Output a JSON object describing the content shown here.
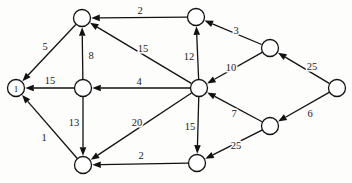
{
  "diagram": {
    "type": "directed-weighted-graph",
    "title": "",
    "background_color": "#fdfdfc",
    "stroke_color": "#111111",
    "nodes": [
      {
        "id": "n1",
        "label": "1",
        "x": 16,
        "y": 88,
        "r": 8.5
      },
      {
        "id": "n2",
        "label": "",
        "x": 82,
        "y": 18,
        "r": 8.5
      },
      {
        "id": "n3",
        "label": "",
        "x": 83,
        "y": 88,
        "r": 8.5
      },
      {
        "id": "n4",
        "label": "",
        "x": 83,
        "y": 165,
        "r": 8.5
      },
      {
        "id": "n5",
        "label": "",
        "x": 196,
        "y": 17,
        "r": 8.5
      },
      {
        "id": "n6",
        "label": "",
        "x": 199,
        "y": 88,
        "r": 8.5
      },
      {
        "id": "n7",
        "label": "",
        "x": 197,
        "y": 163,
        "r": 8.5
      },
      {
        "id": "n8",
        "label": "",
        "x": 270,
        "y": 48,
        "r": 8.5
      },
      {
        "id": "n9",
        "label": "",
        "x": 270,
        "y": 126,
        "r": 8.5
      },
      {
        "id": "n10",
        "label": "",
        "x": 337,
        "y": 88,
        "r": 8.5
      }
    ],
    "edges": [
      {
        "from": "n2",
        "to": "n1",
        "weight": "5",
        "lx": 45,
        "ly": 46
      },
      {
        "from": "n3",
        "to": "n1",
        "weight": "15",
        "lx": 50,
        "ly": 80
      },
      {
        "from": "n4",
        "to": "n1",
        "weight": "1",
        "lx": 44,
        "ly": 137
      },
      {
        "from": "n3",
        "to": "n2",
        "weight": "8",
        "lx": 91,
        "ly": 55
      },
      {
        "from": "n5",
        "to": "n2",
        "weight": "2",
        "lx": 140,
        "ly": 10
      },
      {
        "from": "n6",
        "to": "n2",
        "weight": "15",
        "lx": 143,
        "ly": 48
      },
      {
        "from": "n3",
        "to": "n4",
        "weight": "13",
        "lx": 74,
        "ly": 122
      },
      {
        "from": "n6",
        "to": "n3",
        "weight": "4",
        "lx": 139,
        "ly": 81
      },
      {
        "from": "n6",
        "to": "n4",
        "weight": "20",
        "lx": 137,
        "ly": 122
      },
      {
        "from": "n7",
        "to": "n4",
        "weight": "2",
        "lx": 141,
        "ly": 155
      },
      {
        "from": "n6",
        "to": "n5",
        "weight": "12",
        "lx": 189,
        "ly": 56
      },
      {
        "from": "n8",
        "to": "n5",
        "weight": "3",
        "lx": 236,
        "ly": 30
      },
      {
        "from": "n8",
        "to": "n6",
        "weight": "10",
        "lx": 231,
        "ly": 67
      },
      {
        "from": "n6",
        "to": "n7",
        "weight": "15",
        "lx": 190,
        "ly": 126
      },
      {
        "from": "n9",
        "to": "n6",
        "weight": "7",
        "lx": 234,
        "ly": 113
      },
      {
        "from": "n9",
        "to": "n7",
        "weight": "25",
        "lx": 236,
        "ly": 145
      },
      {
        "from": "n10",
        "to": "n8",
        "weight": "25",
        "lx": 312,
        "ly": 66
      },
      {
        "from": "n10",
        "to": "n9",
        "weight": "6",
        "lx": 310,
        "ly": 113
      }
    ]
  }
}
